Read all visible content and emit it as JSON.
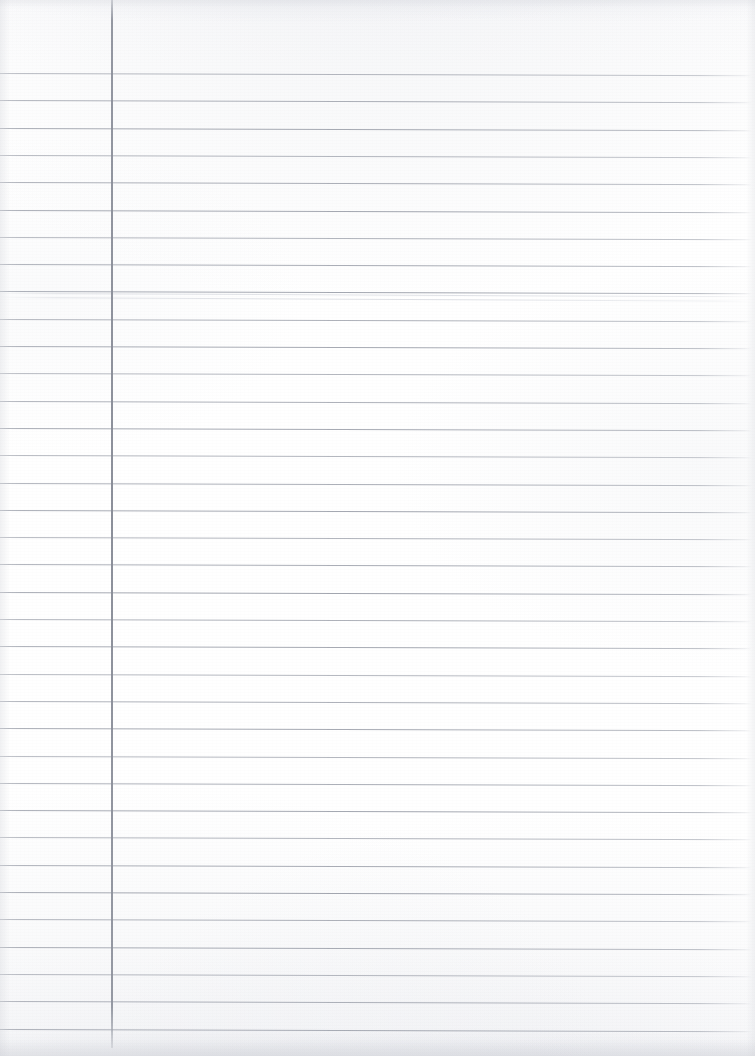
{
  "document": {
    "kind": "scanned-lined-notebook-page",
    "description": "Blank ruled notebook paper scan",
    "content_text": "",
    "page_width": 755,
    "page_height": 1056,
    "background_color": "#ffffff"
  },
  "ruling": {
    "rule_color": "#a0a4ad",
    "margin_rule_color": "#8c909b",
    "first_line_y": 73,
    "line_spacing": 27.3,
    "line_count": 36,
    "line_left_x": 0,
    "line_right_x": 752,
    "skew_degrees": 0.18,
    "margin_rule_x": 111,
    "margin_rule_top": 0,
    "margin_rule_bottom": 1048,
    "header_area_height": 73,
    "ghost_artifact_y": [
      293,
      297
    ]
  },
  "scan": {
    "noise_opacity": 0.5,
    "vignette": "true",
    "paper_tone": "#fdfdfe"
  }
}
